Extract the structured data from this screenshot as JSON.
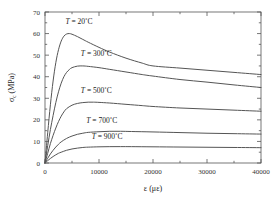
{
  "chart_data": {
    "type": "line",
    "title": "",
    "xlabel": "ε (με)",
    "ylabel": "σc (MPa)",
    "ylabel_main": "σ",
    "ylabel_sub": "c",
    "ylabel_unit": " (MPa)",
    "xlim": [
      0,
      40000
    ],
    "ylim": [
      0,
      70
    ],
    "xticks": [
      0,
      10000,
      20000,
      30000,
      40000
    ],
    "xtick_labels": [
      "0",
      "10000",
      "20000",
      "30000",
      "40000"
    ],
    "x_minor_step": 5000,
    "yticks": [
      0,
      10,
      20,
      30,
      40,
      50,
      60,
      70
    ],
    "ytick_labels": [
      "0",
      "10",
      "20",
      "30",
      "40",
      "50",
      "60",
      "70"
    ],
    "y_minor_step": 5,
    "grid": false,
    "legend_position": "inline-annotations",
    "line_color": "#555555",
    "series": [
      {
        "name": "T = 20°C",
        "label_prefix": "T",
        "label_value": " = 20˚C",
        "label_x": 6300,
        "label_y": 64.5,
        "peak_x": 4500,
        "peak_y": 60,
        "end_y": 41,
        "points": [
          [
            0,
            0
          ],
          [
            500,
            14
          ],
          [
            1000,
            27
          ],
          [
            1500,
            38
          ],
          [
            2000,
            46.5
          ],
          [
            2500,
            52.5
          ],
          [
            3000,
            56.5
          ],
          [
            3500,
            58.8
          ],
          [
            4000,
            59.8
          ],
          [
            4500,
            60.0
          ],
          [
            5000,
            59.7
          ],
          [
            6000,
            58.6
          ],
          [
            7000,
            57.3
          ],
          [
            8000,
            56.0
          ],
          [
            10000,
            53.6
          ],
          [
            12000,
            51.4
          ],
          [
            15000,
            48.6
          ],
          [
            18000,
            46.3
          ],
          [
            20000,
            45.0
          ],
          [
            25000,
            44.0
          ],
          [
            30000,
            43.0
          ],
          [
            35000,
            42.0
          ],
          [
            40000,
            41.0
          ]
        ]
      },
      {
        "name": "T = 300°C",
        "label_prefix": "T",
        "label_value": " = 300˚C",
        "label_x": 9500,
        "label_y": 49.5,
        "peak_x": 7000,
        "peak_y": 45,
        "end_y": 35,
        "points": [
          [
            0,
            0
          ],
          [
            500,
            8
          ],
          [
            1000,
            15.5
          ],
          [
            1500,
            22
          ],
          [
            2000,
            28
          ],
          [
            2500,
            33
          ],
          [
            3000,
            37
          ],
          [
            3500,
            40
          ],
          [
            4000,
            42
          ],
          [
            4500,
            43.3
          ],
          [
            5000,
            44.2
          ],
          [
            6000,
            44.9
          ],
          [
            7000,
            45.0
          ],
          [
            8000,
            44.8
          ],
          [
            10000,
            44.2
          ],
          [
            12000,
            43.4
          ],
          [
            15000,
            42.2
          ],
          [
            18000,
            41.0
          ],
          [
            20000,
            40.3
          ],
          [
            25000,
            38.7
          ],
          [
            30000,
            37.5
          ],
          [
            35000,
            36.2
          ],
          [
            40000,
            35.0
          ]
        ]
      },
      {
        "name": "T = 500°C",
        "label_prefix": "T",
        "label_value": " = 500˚C",
        "label_x": 9500,
        "label_y": 32.5,
        "peak_x": 9000,
        "peak_y": 28.2,
        "end_y": 24,
        "points": [
          [
            0,
            0
          ],
          [
            500,
            4.5
          ],
          [
            1000,
            9
          ],
          [
            1500,
            12.8
          ],
          [
            2000,
            16.2
          ],
          [
            2500,
            19.2
          ],
          [
            3000,
            21.7
          ],
          [
            3500,
            23.7
          ],
          [
            4000,
            25.2
          ],
          [
            5000,
            26.8
          ],
          [
            6000,
            27.6
          ],
          [
            7000,
            28.0
          ],
          [
            8000,
            28.2
          ],
          [
            9000,
            28.2
          ],
          [
            10000,
            28.1
          ],
          [
            12000,
            27.8
          ],
          [
            15000,
            27.2
          ],
          [
            18000,
            26.6
          ],
          [
            20000,
            26.2
          ],
          [
            25000,
            25.5
          ],
          [
            30000,
            25.0
          ],
          [
            35000,
            24.5
          ],
          [
            40000,
            24.0
          ]
        ]
      },
      {
        "name": "T = 700°C",
        "label_prefix": "T",
        "label_value": " = 700˚C",
        "label_x": 10500,
        "label_y": 18.5,
        "peak_x": 13000,
        "peak_y": 14.7,
        "end_y": 13.4,
        "points": [
          [
            0,
            0
          ],
          [
            500,
            2.2
          ],
          [
            1000,
            4.2
          ],
          [
            1500,
            5.9
          ],
          [
            2000,
            7.4
          ],
          [
            2500,
            8.7
          ],
          [
            3000,
            9.8
          ],
          [
            4000,
            11.4
          ],
          [
            5000,
            12.5
          ],
          [
            6000,
            13.3
          ],
          [
            7000,
            13.8
          ],
          [
            8000,
            14.2
          ],
          [
            10000,
            14.5
          ],
          [
            12000,
            14.7
          ],
          [
            14000,
            14.7
          ],
          [
            16000,
            14.6
          ],
          [
            20000,
            14.4
          ],
          [
            25000,
            14.1
          ],
          [
            30000,
            13.8
          ],
          [
            35000,
            13.6
          ],
          [
            40000,
            13.4
          ]
        ]
      },
      {
        "name": "T = 900°C",
        "label_prefix": "T",
        "label_value": " = 900˚C",
        "label_x": 11500,
        "label_y": 11.0,
        "peak_x": 14000,
        "peak_y": 7.6,
        "end_y": 7.1,
        "points": [
          [
            0,
            0
          ],
          [
            500,
            1.1
          ],
          [
            1000,
            2.1
          ],
          [
            1500,
            3.0
          ],
          [
            2000,
            3.8
          ],
          [
            2500,
            4.5
          ],
          [
            3000,
            5.0
          ],
          [
            4000,
            5.9
          ],
          [
            5000,
            6.5
          ],
          [
            6000,
            6.9
          ],
          [
            7000,
            7.2
          ],
          [
            8000,
            7.35
          ],
          [
            10000,
            7.5
          ],
          [
            12000,
            7.58
          ],
          [
            14000,
            7.6
          ],
          [
            16000,
            7.58
          ],
          [
            20000,
            7.5
          ],
          [
            25000,
            7.4
          ],
          [
            30000,
            7.3
          ],
          [
            35000,
            7.2
          ],
          [
            40000,
            7.1
          ]
        ]
      }
    ]
  }
}
